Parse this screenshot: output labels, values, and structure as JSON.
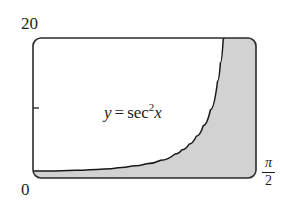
{
  "figure": {
    "caption_equation": {
      "lhs": "y",
      "equals": "=",
      "fn": "sec",
      "exponent": "2",
      "arg": "x",
      "plain": "y = sec^2 x"
    },
    "axis_labels": {
      "y_max": "20",
      "y_min": "0",
      "x_max_numerator": "π",
      "x_max_denominator": "2",
      "x_max_plain": "π/2"
    },
    "colors": {
      "shade": "#d2d2d2",
      "curve": "#1a1a1a",
      "frame": "#2b2b2b",
      "background": "#ffffff",
      "text": "#1d1d1d"
    }
  },
  "chart_data": {
    "type": "line",
    "title": "",
    "subtitle": "",
    "xlabel": "",
    "ylabel": "",
    "function": "y = sec^2 x",
    "xlim": [
      0,
      1.5707963
    ],
    "ylim": [
      0,
      20
    ],
    "xtick_labels": [
      "0",
      "π/2"
    ],
    "ytick_labels": [
      "0",
      "20"
    ],
    "y_minor_tick_values": [
      10
    ],
    "grid": false,
    "legend": false,
    "annotations": [
      {
        "text": "y = sec^2 x",
        "x": 0.68,
        "y": 9.0
      }
    ],
    "series": [
      {
        "name": "y = sec^2 x",
        "x": [
          0.0,
          0.1,
          0.2,
          0.3,
          0.4,
          0.5,
          0.6,
          0.7,
          0.8,
          0.9,
          1.0,
          1.05,
          1.1,
          1.15,
          1.2,
          1.25,
          1.3,
          1.32,
          1.34,
          1.3452
        ],
        "values": [
          1.0,
          1.01,
          1.041,
          1.096,
          1.182,
          1.299,
          1.468,
          1.707,
          2.046,
          2.54,
          3.426,
          4.036,
          4.85,
          5.964,
          7.509,
          9.753,
          13.83,
          16.45,
          19.85,
          20.0
        ]
      }
    ],
    "shaded_region": {
      "description": "area under y = sec^2 x from x=0 to x=pi/2, clipped at y=20",
      "fill": "#d2d2d2",
      "x_from": 0,
      "x_to": 1.5707963,
      "y_from": 0,
      "y_to": 20
    }
  }
}
